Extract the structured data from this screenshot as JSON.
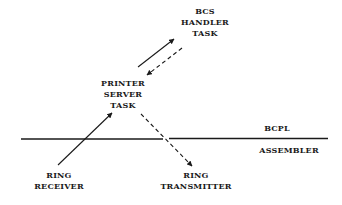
{
  "diagram": {
    "nodes": {
      "bcs_handler": {
        "lines": [
          "BCS",
          "HANDLER",
          "TASK"
        ]
      },
      "printer_server": {
        "lines": [
          "PRINTER",
          "SERVER",
          "TASK"
        ]
      },
      "ring_receiver": {
        "lines": [
          "RING",
          "RECEIVER"
        ]
      },
      "ring_transmitter": {
        "lines": [
          "RING",
          "TRANSMITTER"
        ]
      }
    },
    "layers": {
      "upper": "BCPL",
      "lower": "ASSEMBLER"
    },
    "edges": [
      {
        "from": "printer_server",
        "to": "bcs_handler",
        "style": "solid"
      },
      {
        "from": "bcs_handler",
        "to": "printer_server",
        "style": "dashed"
      },
      {
        "from": "ring_receiver",
        "to": "printer_server",
        "style": "solid"
      },
      {
        "from": "printer_server",
        "to": "ring_transmitter",
        "style": "dashed"
      }
    ],
    "colors": {
      "ink": "#1a1a1a",
      "background": "#ffffff"
    }
  }
}
